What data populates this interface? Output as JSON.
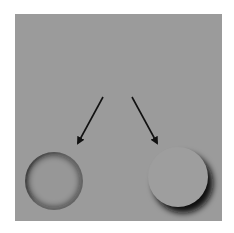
{
  "figure": {
    "background_color": "#9b9b9b",
    "page_color": "#ffffff",
    "shadow_color": "#0d0d0d",
    "top_shape": {
      "kind": "crescent",
      "label": "crescent-shadow"
    },
    "arrows": [
      {
        "label": "to-concave",
        "from": [
          103,
          97
        ],
        "to": [
          77,
          145
        ]
      },
      {
        "label": "to-convex",
        "from": [
          132,
          97
        ],
        "to": [
          158,
          145
        ]
      }
    ],
    "bottom_shapes": [
      {
        "kind": "concave-hole",
        "label": "hole",
        "cx": 54,
        "cy": 181,
        "r": 29
      },
      {
        "kind": "convex-bump",
        "label": "bump",
        "cx": 178,
        "cy": 177,
        "r": 30
      }
    ]
  }
}
